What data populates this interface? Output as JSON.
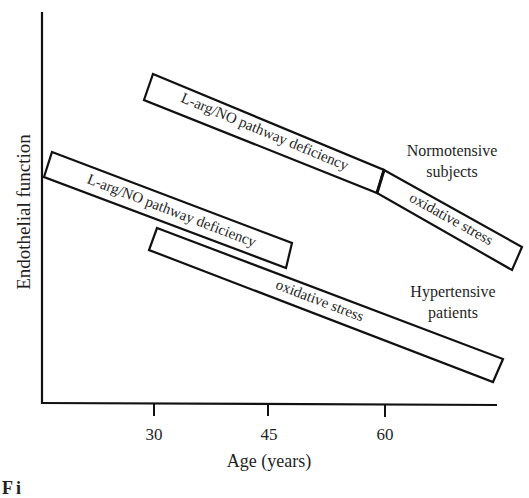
{
  "diagram": {
    "y_axis_label": "Endothelial function",
    "x_axis_label": "Age (years)",
    "x_ticks": [
      "30",
      "45",
      "60"
    ],
    "groups": [
      {
        "name": "Normotensive subjects",
        "label_line1": "Normotensive",
        "label_line2": "subjects",
        "boxes": [
          {
            "label": "L-arg/NO pathway deficiency",
            "start_age": 30,
            "end_age": 60
          },
          {
            "label": "oxidative stress",
            "start_age": 60,
            "end_age": 78
          }
        ]
      },
      {
        "name": "Hypertensive patients",
        "label_line1": "Hypertensive",
        "label_line2": "patients",
        "boxes": [
          {
            "label": "L-arg/NO pathway deficiency",
            "start_age": 16,
            "end_age": 47
          },
          {
            "label": "oxidative stress",
            "start_age": 30,
            "end_age": 76
          }
        ]
      }
    ],
    "caption_fragment": "Fi"
  }
}
